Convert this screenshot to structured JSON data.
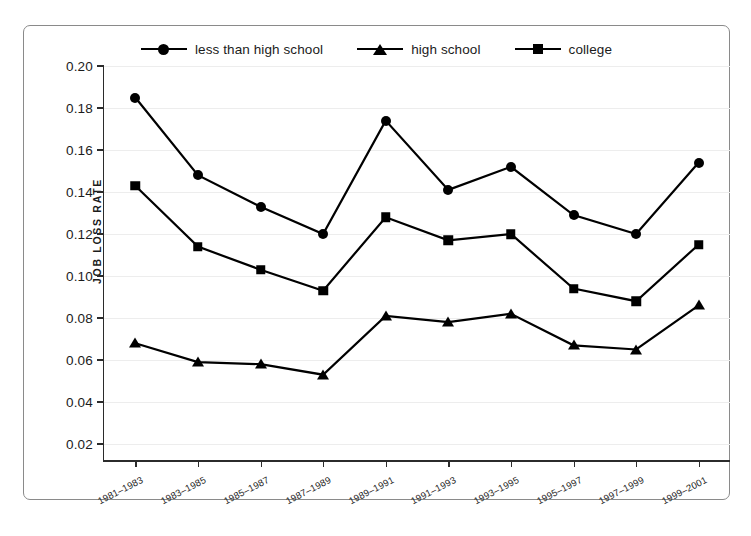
{
  "figure": {
    "background_color": "#ffffff",
    "border_color": "#8a8a8a",
    "line_color": "#000000",
    "gridline_color": "#ededed"
  },
  "legend": {
    "position": "top-center",
    "entries": [
      {
        "label": "less than high school",
        "marker": "circle",
        "marker_name": "legend-marker-circle"
      },
      {
        "label": "high school",
        "marker": "triangle",
        "marker_name": "legend-marker-triangle"
      },
      {
        "label": "college",
        "marker": "square",
        "marker_name": "legend-marker-square"
      }
    ]
  },
  "axes": {
    "ylabel": "JOB LOSS RATE",
    "yticks": [
      "0.20",
      "0.18",
      "0.16",
      "0.14",
      "0.12",
      "0.10",
      "0.08",
      "0.06",
      "0.04",
      "0.02"
    ],
    "ytick_values": [
      0.2,
      0.18,
      0.16,
      0.14,
      0.12,
      0.1,
      0.08,
      0.06,
      0.04,
      0.02
    ],
    "ylim": [
      0.0,
      0.21
    ],
    "xlabel": "",
    "xticks": [
      "1981–1983",
      "1983–1985",
      "1985–1987",
      "1987–1989",
      "1989–1991",
      "1991–1993",
      "1993–1995",
      "1995–1997",
      "1997–1999",
      "1999–2001"
    ]
  },
  "caption": "",
  "chart_data": {
    "type": "line",
    "title": "",
    "subtitle": "",
    "xlabel": "",
    "ylabel": "JOB LOSS RATE",
    "ylim": [
      0.0,
      0.21
    ],
    "grid": true,
    "legend_position": "top-center",
    "categories": [
      "1981–1983",
      "1983–1985",
      "1985–1987",
      "1987–1989",
      "1989–1991",
      "1991–1993",
      "1993–1995",
      "1995–1997",
      "1997–1999",
      "1999–2001"
    ],
    "series": [
      {
        "name": "less than high school",
        "marker": "circle",
        "values": [
          0.185,
          0.148,
          0.133,
          0.12,
          0.174,
          0.141,
          0.152,
          0.129,
          0.12,
          0.154
        ]
      },
      {
        "name": "college",
        "marker": "square",
        "values": [
          0.143,
          0.114,
          0.103,
          0.093,
          0.128,
          0.117,
          0.12,
          0.094,
          0.088,
          0.115
        ]
      },
      {
        "name": "high school",
        "marker": "triangle",
        "values": [
          0.068,
          0.059,
          0.058,
          0.053,
          0.081,
          0.078,
          0.082,
          0.067,
          0.065,
          0.086
        ]
      }
    ]
  }
}
